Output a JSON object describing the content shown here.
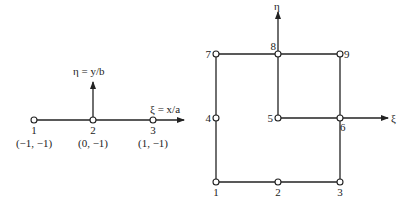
{
  "left_element": {
    "xi_axis_label": "ξ = x/a",
    "eta_axis_label": "η = y/b",
    "nodes": [
      {
        "id": "1",
        "coords": "(−1, −1)"
      },
      {
        "id": "2",
        "coords": "(0, −1)"
      },
      {
        "id": "3",
        "coords": "(1, −1)"
      }
    ]
  },
  "right_element": {
    "xi_axis_label": "ξ",
    "eta_axis_label": "η",
    "nodes": [
      {
        "id": "1"
      },
      {
        "id": "2"
      },
      {
        "id": "3"
      },
      {
        "id": "4"
      },
      {
        "id": "5"
      },
      {
        "id": "6"
      },
      {
        "id": "7"
      },
      {
        "id": "8"
      },
      {
        "id": "9"
      }
    ]
  },
  "colors": {
    "line": "#222222",
    "node_fill": "#ffffff"
  }
}
